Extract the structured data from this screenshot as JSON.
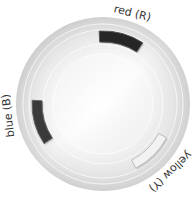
{
  "chart_data": {
    "type": "radial-arc",
    "title": "",
    "center": [
      103,
      104
    ],
    "outer_radius": 87,
    "background": {
      "style": "radial-gradient",
      "outer_color": "#d4d4d4",
      "inner_color": "#ffffff",
      "ring_radii": [
        80,
        74,
        60,
        50
      ]
    },
    "categories": [
      "red (R)",
      "blue (B)",
      "yellow (Y)"
    ],
    "series": [
      {
        "name": "red (R)",
        "label": "red (R)",
        "start_angle": -93,
        "end_angle": -57,
        "inner_radius": 62,
        "outer_radius": 73,
        "fill": "#262626",
        "stroke": "#555555",
        "label_angle": -72,
        "label_rotation": 14
      },
      {
        "name": "blue (B)",
        "label": "blue (B)",
        "start_angle": 146,
        "end_angle": 183,
        "inner_radius": 61,
        "outer_radius": 71,
        "fill": "#3a3a3a",
        "stroke": "#666666",
        "label_angle": 173,
        "label_rotation": -97
      },
      {
        "name": "yellow (Y)",
        "label": "yellow (Y)",
        "start_angle": 28,
        "end_angle": 63,
        "inner_radius": 63,
        "outer_radius": 72,
        "fill": "#f2f2f2",
        "stroke": "#bdbdbd",
        "label_angle": 45,
        "label_rotation": 137
      }
    ]
  }
}
